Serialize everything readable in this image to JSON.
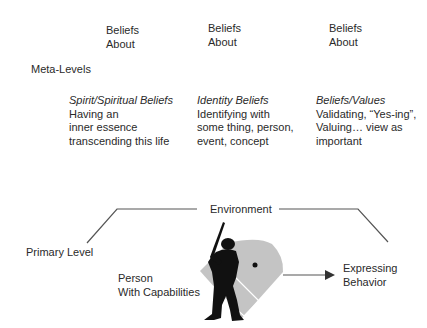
{
  "header_columns": [
    {
      "line1": "Beliefs",
      "line2": "About"
    },
    {
      "line1": "Beliefs",
      "line2": "About"
    },
    {
      "line1": "Beliefs",
      "line2": "About"
    }
  ],
  "meta_levels_label": "Meta-Levels",
  "belief_columns": [
    {
      "title": "Spirit/Spiritual Beliefs",
      "lines": [
        "Having an",
        "inner essence",
        "transcending this life"
      ]
    },
    {
      "title": "Identity Beliefs",
      "lines": [
        "Identifying with",
        "some thing, person,",
        "event, concept"
      ]
    },
    {
      "title": "Beliefs/Values",
      "lines": [
        "Validating, “Yes-ing”,",
        "Valuing… view as",
        "important"
      ]
    }
  ],
  "environment_label": "Environment",
  "primary_level_label": "Primary Level",
  "person_label": {
    "line1": "Person",
    "line2": "With Capabilities"
  },
  "behavior_label": {
    "line1": "Expressing",
    "line2": "Behavior"
  },
  "colors": {
    "text": "#2a2a2a",
    "lines": "#555555",
    "field": "#c4c4c4",
    "silhouette": "#111111"
  }
}
